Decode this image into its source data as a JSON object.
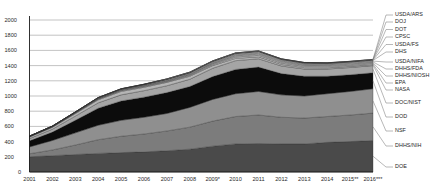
{
  "chart_data": {
    "type": "area",
    "title": "",
    "subtitle": "",
    "xlabel": "",
    "ylabel": "",
    "stacked": true,
    "grid": true,
    "legend_position": "right",
    "ylim": [
      0,
      2000
    ],
    "yticks": [
      "0",
      "200",
      "400",
      "600",
      "800",
      "1000",
      "1200",
      "1400",
      "1600",
      "1800",
      "2000"
    ],
    "categories": [
      "2001",
      "2002",
      "2003",
      "2004",
      "2005",
      "2006",
      "2007",
      "2008",
      "2009*",
      "2010",
      "2011",
      "2012",
      "2013",
      "2014",
      "2015**",
      "2016***"
    ],
    "series": [
      {
        "name": "DOE",
        "color": "#4a4a4a",
        "values": [
          200,
          215,
          230,
          245,
          255,
          265,
          280,
          300,
          340,
          370,
          375,
          370,
          370,
          390,
          400,
          415
        ]
      },
      {
        "name": "DHHS/NIH",
        "color": "#7c7c7c",
        "values": [
          40,
          75,
          125,
          180,
          215,
          235,
          260,
          290,
          330,
          360,
          375,
          350,
          340,
          340,
          350,
          360
        ]
      },
      {
        "name": "NSF",
        "color": "#8f8f8f",
        "values": [
          90,
          125,
          160,
          190,
          210,
          220,
          230,
          260,
          285,
          300,
          310,
          295,
          290,
          300,
          310,
          320
        ]
      },
      {
        "name": "DOD",
        "color": "#0c0c0c",
        "values": [
          80,
          110,
          165,
          225,
          255,
          265,
          275,
          275,
          300,
          320,
          320,
          280,
          260,
          230,
          220,
          210
        ]
      },
      {
        "name": "DOC/NIST",
        "color": "#a5a5a5",
        "values": [
          30,
          38,
          55,
          70,
          80,
          85,
          90,
          95,
          110,
          115,
          110,
          100,
          95,
          95,
          95,
          95
        ]
      },
      {
        "name": "NASA",
        "color": "#b5b5b5",
        "values": [
          20,
          25,
          32,
          40,
          45,
          45,
          45,
          40,
          35,
          30,
          25,
          20,
          18,
          16,
          15,
          15
        ]
      },
      {
        "name": "EPA",
        "color": "#c0c0c0",
        "values": [
          5,
          6,
          8,
          9,
          10,
          10,
          10,
          12,
          14,
          18,
          20,
          18,
          16,
          15,
          15,
          15
        ]
      },
      {
        "name": "DHHS/NIOSH",
        "color": "#c9c9c9",
        "values": [
          2,
          3,
          4,
          5,
          6,
          7,
          8,
          10,
          12,
          14,
          15,
          15,
          14,
          13,
          13,
          13
        ]
      },
      {
        "name": "DHHS/FDA",
        "color": "#d0d0d0",
        "values": [
          1,
          2,
          2,
          3,
          4,
          5,
          6,
          7,
          8,
          10,
          12,
          12,
          11,
          11,
          11,
          11
        ]
      },
      {
        "name": "USDA/NIFA",
        "color": "#d6d6d6",
        "values": [
          2,
          3,
          4,
          5,
          6,
          7,
          8,
          9,
          10,
          11,
          12,
          11,
          10,
          10,
          10,
          10
        ]
      },
      {
        "name": "DHS",
        "color": "#dcdcdc",
        "values": [
          1,
          1,
          2,
          3,
          4,
          5,
          6,
          7,
          8,
          9,
          9,
          8,
          7,
          7,
          7,
          7
        ]
      },
      {
        "name": "USDA/FS",
        "color": "#e1e1e1",
        "values": [
          1,
          1,
          1,
          2,
          2,
          3,
          3,
          4,
          5,
          5,
          5,
          5,
          5,
          5,
          5,
          5
        ]
      },
      {
        "name": "CPSC",
        "color": "#e6e6e6",
        "values": [
          0,
          0,
          1,
          1,
          1,
          1,
          2,
          2,
          2,
          2,
          2,
          2,
          2,
          2,
          2,
          2
        ]
      },
      {
        "name": "DOT",
        "color": "#ebebeb",
        "values": [
          0,
          0,
          1,
          1,
          1,
          1,
          1,
          2,
          2,
          2,
          2,
          2,
          2,
          2,
          2,
          2
        ]
      },
      {
        "name": "DOJ",
        "color": "#f0f0f0",
        "values": [
          0,
          0,
          0,
          1,
          1,
          1,
          1,
          1,
          1,
          1,
          1,
          1,
          1,
          1,
          1,
          1
        ]
      },
      {
        "name": "USDA/ARS",
        "color": "#f5f5f5",
        "values": [
          0,
          0,
          0,
          0,
          1,
          1,
          1,
          1,
          1,
          1,
          1,
          1,
          1,
          1,
          1,
          1
        ]
      }
    ],
    "legend_entries": [
      "USDA/ARS",
      "DOJ",
      "DOT",
      "CPSC",
      "USDA/FS",
      "DHS",
      "USDA/NIFA",
      "DHHS/FDA",
      "DHHS/NIOSH",
      "EPA",
      "NASA",
      "DOC/NIST",
      "DOD",
      "NSF",
      "DHHS/NIH",
      "DOE"
    ]
  }
}
